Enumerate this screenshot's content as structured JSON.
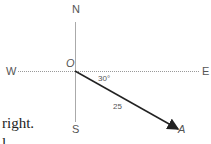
{
  "diagram": {
    "compass": {
      "north": "N",
      "south": "S",
      "east": "E",
      "west": "W"
    },
    "origin_label": "O",
    "angle_label": "30°",
    "magnitude_label": "25",
    "endpoint_label": "A",
    "colors": {
      "axis": "#999999",
      "vector": "#222222",
      "text": "#555555"
    }
  },
  "text_fragment": {
    "line1": "right.",
    "line2": "l"
  }
}
